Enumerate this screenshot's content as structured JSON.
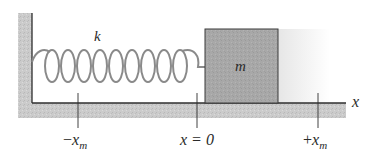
{
  "diagram": {
    "labels": {
      "spring_constant": "k",
      "mass": "m",
      "axis": "x",
      "neg_amplitude_sign": "−",
      "neg_amplitude_var": "x",
      "neg_amplitude_sub": "m",
      "equilibrium": "x = 0",
      "pos_amplitude_sign": "+",
      "pos_amplitude_var": "x",
      "pos_amplitude_sub": "m"
    },
    "colors": {
      "wall_fill": "#c8c8c8",
      "floor_fill": "#c8c8c8",
      "block_fill": "#a9a9a9",
      "spring": "#8a8a8a",
      "outline": "#2e2e2e",
      "shadow": "#ececec"
    }
  }
}
